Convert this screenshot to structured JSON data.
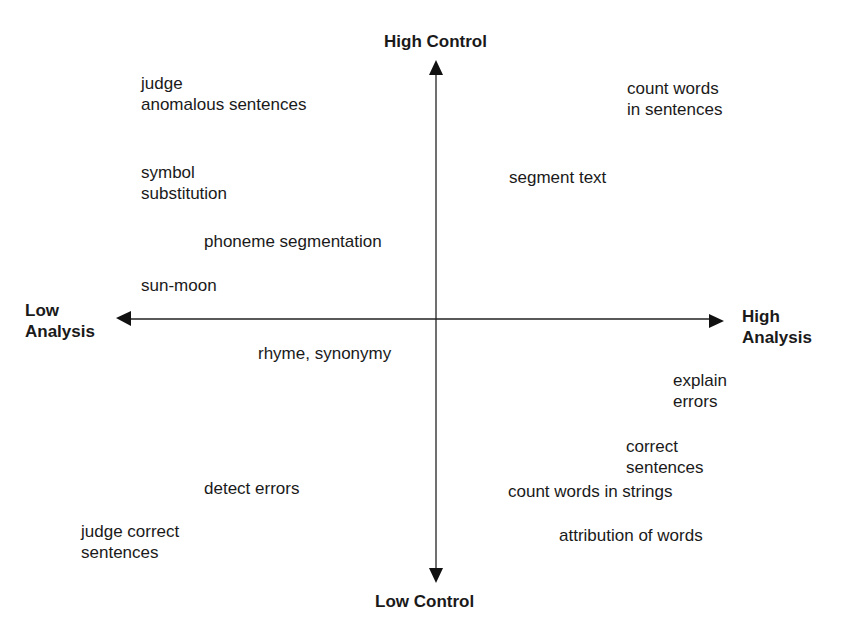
{
  "diagram": {
    "type": "quadrant",
    "axes": {
      "top": "High Control",
      "bottom": "Low Control",
      "left": [
        "Low",
        "Analysis"
      ],
      "right": [
        "High",
        "Analysis"
      ]
    },
    "items": [
      {
        "lines": [
          "judge",
          "anomalous sentences"
        ],
        "x": 141,
        "y": 73
      },
      {
        "lines": [
          "count words",
          "in sentences"
        ],
        "x": 627,
        "y": 78
      },
      {
        "lines": [
          "symbol",
          "substitution"
        ],
        "x": 141,
        "y": 162
      },
      {
        "lines": [
          "segment text"
        ],
        "x": 509,
        "y": 167
      },
      {
        "lines": [
          "phoneme segmentation"
        ],
        "x": 204,
        "y": 231
      },
      {
        "lines": [
          "sun-moon"
        ],
        "x": 141,
        "y": 275
      },
      {
        "lines": [
          "rhyme, synonymy"
        ],
        "x": 258,
        "y": 343
      },
      {
        "lines": [
          "explain",
          "errors"
        ],
        "x": 673,
        "y": 370
      },
      {
        "lines": [
          "correct",
          "sentences"
        ],
        "x": 626,
        "y": 436
      },
      {
        "lines": [
          "detect errors"
        ],
        "x": 204,
        "y": 478
      },
      {
        "lines": [
          "count words in strings"
        ],
        "x": 508,
        "y": 481
      },
      {
        "lines": [
          "judge correct",
          "sentences"
        ],
        "x": 81,
        "y": 521
      },
      {
        "lines": [
          "attribution of words"
        ],
        "x": 559,
        "y": 525
      }
    ]
  }
}
